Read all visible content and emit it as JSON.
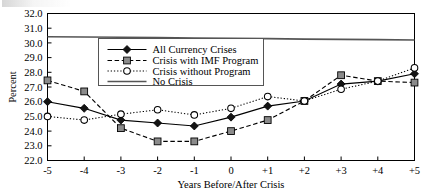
{
  "figure": {
    "background_color": "#ffffff",
    "ink_color": "#000000"
  },
  "chart_data": {
    "type": "line",
    "title": "",
    "xlabel": "Years Before/After Crisis",
    "ylabel": "Percent",
    "x": [
      "-5",
      "-4",
      "-3",
      "-2",
      "-1",
      "0",
      "+1",
      "+2",
      "+3",
      "+4",
      "+5"
    ],
    "xlim": [
      -5,
      5
    ],
    "ylim": [
      22.0,
      32.0
    ],
    "yticks": [
      "32.0",
      "31.0",
      "30.0",
      "29.0",
      "28.0",
      "27.0",
      "26.0",
      "25.0",
      "24.0",
      "23.0",
      "22.0"
    ],
    "xticks": [
      "-5",
      "-4",
      "-3",
      "-2",
      "-1",
      "0",
      "+1",
      "+2",
      "+3",
      "+4",
      "+5"
    ],
    "grid": false,
    "legend_position": "upper-center",
    "series": [
      {
        "name": "All Currency Crises",
        "marker": "filled-diamond",
        "linestyle": "solid",
        "color": "#000000",
        "values": [
          26.0,
          25.55,
          24.75,
          24.55,
          24.35,
          24.95,
          25.7,
          26.05,
          27.2,
          27.4,
          27.9
        ]
      },
      {
        "name": "Crisis with IMF Program",
        "marker": "gray-square",
        "linestyle": "dashed",
        "color": "#8b8b8b",
        "values": [
          27.45,
          26.7,
          24.2,
          23.3,
          23.3,
          24.0,
          24.75,
          26.05,
          27.8,
          27.4,
          27.3
        ]
      },
      {
        "name": "Crisis without Program",
        "marker": "open-circle",
        "linestyle": "dotted",
        "color": "#ffffff",
        "values": [
          25.0,
          24.75,
          25.15,
          25.45,
          25.1,
          25.55,
          26.35,
          26.05,
          26.85,
          27.4,
          28.3
        ]
      },
      {
        "name": "No Crisis",
        "marker": "none",
        "linestyle": "solid",
        "color": "#555555",
        "values": [
          30.42,
          30.4,
          30.38,
          30.36,
          30.33,
          30.31,
          30.29,
          30.26,
          30.24,
          30.22,
          30.2
        ]
      }
    ],
    "legend": [
      "All Currency Crises",
      "Crisis with IMF Program",
      "Crisis without Program",
      "No Crisis"
    ]
  }
}
